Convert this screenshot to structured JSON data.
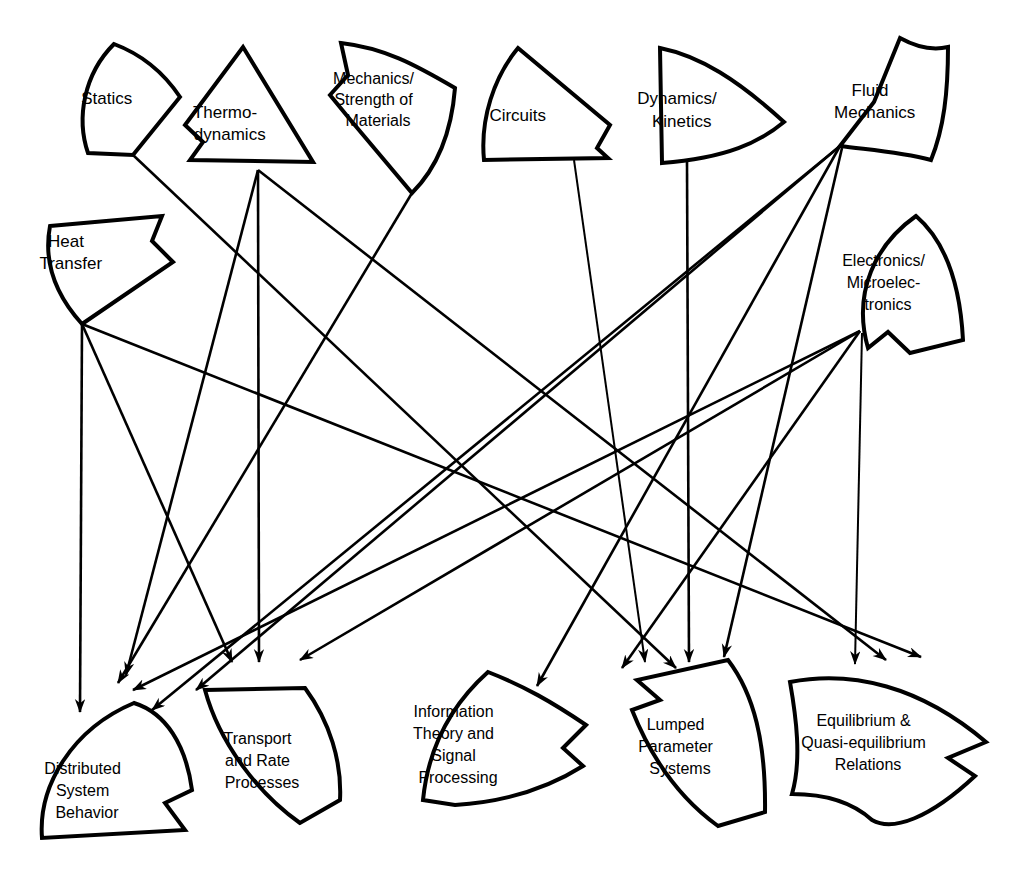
{
  "diagram": {
    "background_color": "#ffffff",
    "line_color": "#000000",
    "node_fill": "#ffffff",
    "source_nodes": [
      {
        "id": "statics",
        "label_lines": [
          "Statics"
        ]
      },
      {
        "id": "thermodynamics",
        "label_lines": [
          "Thermo-",
          "dynamics"
        ]
      },
      {
        "id": "mechanics",
        "label_lines": [
          "Mechanics/",
          "Strength of",
          "Materials"
        ]
      },
      {
        "id": "circuits",
        "label_lines": [
          "Circuits"
        ]
      },
      {
        "id": "dynamics",
        "label_lines": [
          "Dynamics/",
          "Kinetics"
        ]
      },
      {
        "id": "fluid",
        "label_lines": [
          "Fluid",
          "Mechanics"
        ]
      },
      {
        "id": "heat",
        "label_lines": [
          "Heat",
          "Transfer"
        ]
      },
      {
        "id": "electronics",
        "label_lines": [
          "Electronics/",
          "Microelec-",
          "tronics"
        ]
      }
    ],
    "target_nodes": [
      {
        "id": "distributed",
        "label_lines": [
          "Distributed",
          "System",
          "Behavior"
        ],
        "incoming_arrows": 4
      },
      {
        "id": "transport",
        "label_lines": [
          "Transport",
          "and Rate",
          "Processes"
        ],
        "incoming_arrows": 3
      },
      {
        "id": "information",
        "label_lines": [
          "Information",
          "Theory and",
          "Signal",
          "Processing"
        ],
        "incoming_arrows": 1
      },
      {
        "id": "lumped",
        "label_lines": [
          "Lumped",
          "Parameter",
          "Systems"
        ],
        "incoming_arrows": 4
      },
      {
        "id": "equilibrium",
        "label_lines": [
          "Equilibrium &",
          "Quasi-equilibrium",
          "Relations"
        ],
        "incoming_arrows": 3
      }
    ],
    "edges": [
      {
        "from": "statics",
        "to": "lumped"
      },
      {
        "from": "thermodynamics",
        "to": "distributed"
      },
      {
        "from": "thermodynamics",
        "to": "transport"
      },
      {
        "from": "thermodynamics",
        "to": "equilibrium"
      },
      {
        "from": "mechanics",
        "to": "distributed"
      },
      {
        "from": "circuits",
        "to": "lumped"
      },
      {
        "from": "dynamics",
        "to": "lumped"
      },
      {
        "from": "fluid",
        "to": "distributed"
      },
      {
        "from": "fluid",
        "to": "transport"
      },
      {
        "from": "fluid",
        "to": "equilibrium"
      },
      {
        "from": "fluid",
        "to": "lumped"
      },
      {
        "from": "heat",
        "to": "distributed"
      },
      {
        "from": "heat",
        "to": "transport"
      },
      {
        "from": "heat",
        "to": "equilibrium"
      },
      {
        "from": "electronics",
        "to": "distributed"
      },
      {
        "from": "electronics",
        "to": "information"
      },
      {
        "from": "electronics",
        "to": "lumped"
      },
      {
        "from": "electronics",
        "to": "equilibrium"
      }
    ]
  }
}
